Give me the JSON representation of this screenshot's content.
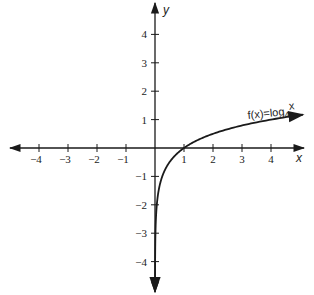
{
  "chart_data": {
    "type": "line",
    "title": "",
    "function_label": "f(x)=log",
    "function_base": "4",
    "function_arg": "x",
    "xlabel": "x",
    "ylabel": "y",
    "xlim": [
      -4.9,
      5.1
    ],
    "ylim": [
      -5.0,
      5.0
    ],
    "grid": false,
    "legend": "none",
    "x_ticks": [
      -4,
      -3,
      -2,
      -1,
      1,
      2,
      3,
      4
    ],
    "x_tick_labels": [
      "−4",
      "−3",
      "−2",
      "−1",
      "1",
      "2",
      "3",
      "4"
    ],
    "y_ticks": [
      4,
      3,
      2,
      1,
      -1,
      -2,
      -3,
      -4
    ],
    "y_tick_labels": [
      "4",
      "3",
      "2",
      "1",
      "−1",
      "−2",
      "−3",
      "−4"
    ],
    "series": [
      {
        "name": "f(x)=log4 x",
        "x": [
          0.0625,
          0.125,
          0.25,
          0.5,
          1,
          2,
          3,
          4,
          5
        ],
        "values": [
          -2,
          -1.5,
          -1,
          -0.5,
          0,
          0.5,
          0.79,
          1,
          1.16
        ]
      }
    ]
  },
  "layout": {
    "origin_px": [
      155,
      148
    ],
    "unit_x_px": 29,
    "unit_y_px": 28.4,
    "ink_color": "#1a1a1a"
  }
}
